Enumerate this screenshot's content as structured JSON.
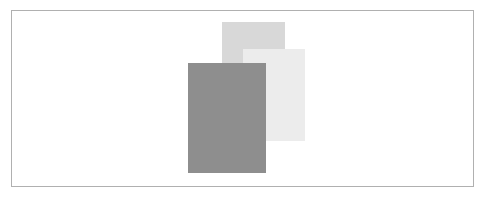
{
  "figure": {
    "canvas": {
      "width": 487,
      "height": 197,
      "background_color": "#ffffff"
    },
    "frame": {
      "name": "figure-border",
      "x": 11,
      "y": 10,
      "width": 463,
      "height": 177,
      "border_color": "#b0b0b0",
      "border_width": 1,
      "fill_color": "#ffffff"
    },
    "shapes": [
      {
        "id": "rect-back",
        "label": "medium-grey-rectangle",
        "z_order": 1,
        "x": 222,
        "y": 22,
        "width": 63,
        "height": 43,
        "fill_color": "#d8d8d8"
      },
      {
        "id": "rect-middle",
        "label": "light-grey-rectangle",
        "z_order": 2,
        "x": 243,
        "y": 49,
        "width": 62,
        "height": 92,
        "fill_color": "#ececec"
      },
      {
        "id": "rect-front",
        "label": "dark-grey-rectangle",
        "z_order": 3,
        "x": 188,
        "y": 63,
        "width": 78,
        "height": 110,
        "fill_color": "#8e8e8e"
      }
    ]
  }
}
